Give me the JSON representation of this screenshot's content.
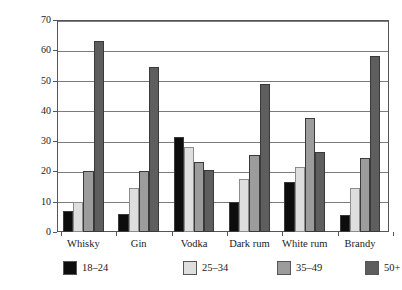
{
  "chart_data": {
    "type": "bar",
    "title": "",
    "subtitle": "",
    "xlabel": "",
    "ylabel": "weekly drinkers %",
    "ylim": [
      0,
      70
    ],
    "ytick_step": 10,
    "yticks": [
      0,
      10,
      20,
      30,
      40,
      50,
      60,
      70
    ],
    "grid": true,
    "grid_axis": "y",
    "legend_position": "bottom-left",
    "categories": [
      "Whisky",
      "Gin",
      "Vodka",
      "Dark rum",
      "White rum",
      "Brandy"
    ],
    "series": [
      {
        "name": "18–24",
        "color": "#0d0d0d",
        "values": [
          7,
          6,
          31.5,
          10,
          16.5,
          5.5
        ]
      },
      {
        "name": "25–34",
        "color": "#dedede",
        "values": [
          10,
          14.5,
          28,
          17.5,
          21.5,
          14.5
        ]
      },
      {
        "name": "35–49",
        "color": "#9c9c9c",
        "values": [
          20,
          20,
          23,
          25.5,
          37.5,
          24.5
        ]
      },
      {
        "name": "50+",
        "color": "#5e5e5e",
        "values": [
          63,
          54.5,
          20.5,
          49,
          26.5,
          58
        ]
      }
    ]
  }
}
